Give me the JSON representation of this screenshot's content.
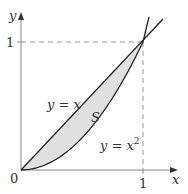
{
  "figure": {
    "type": "region-between-curves",
    "region_label": "S",
    "curves": [
      {
        "label": "y = x",
        "expr": "x"
      },
      {
        "label": "y = x²",
        "expr": "x^2",
        "label_base": "y = x",
        "label_sup": "2"
      }
    ],
    "axes": {
      "x_label": "x",
      "y_label": "y",
      "origin_label": "0",
      "x_tick_label": "1",
      "y_tick_label": "1"
    },
    "colors": {
      "fill": "#e0e0e0",
      "curve": "#222222",
      "axis": "#888888",
      "dashed": "#999999",
      "text": "#333333"
    }
  }
}
